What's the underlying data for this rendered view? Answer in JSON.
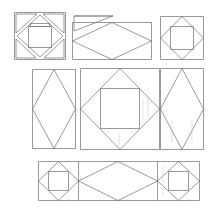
{
  "document": {
    "title": "Quilt Block Pattern Diagram",
    "kind": "patchwork-piecing-diagram",
    "canvas": {
      "width": 216,
      "height": 208,
      "background": "#ffffff"
    }
  },
  "style": {
    "line_color": "#6e6e6e",
    "line_color_dark": "#555555",
    "line_color_light": "#b9b9b9",
    "line_width": 0.7,
    "fill": "none"
  },
  "rows": [
    {
      "name": "top-row",
      "blocks": [
        {
          "id": "block-exploded-square-in-square",
          "name": "exploded-square-in-square-block",
          "label": "Square in a square, pieces separated",
          "x": 14,
          "y": 12,
          "w": 52,
          "h": 48
        },
        {
          "id": "block-wide-diamond-with-loose-triangle",
          "name": "wide-diamond-rectangle-block",
          "label": "Diamond in wide rectangle with loose triangle",
          "x": 72,
          "y": 15,
          "w": 80,
          "h": 45
        },
        {
          "id": "block-square-in-square-top-right",
          "name": "square-in-square-block",
          "label": "Square in a square",
          "x": 160,
          "y": 16,
          "w": 44,
          "h": 44
        }
      ]
    },
    {
      "name": "middle-row",
      "blocks": [
        {
          "id": "block-tall-diamond-left",
          "name": "tall-diamond-rectangle-block",
          "label": "Tall diamond in vertical rectangle",
          "x": 32,
          "y": 69,
          "w": 44,
          "h": 80
        },
        {
          "id": "block-big-square-in-square-center",
          "name": "large-square-in-square-block",
          "label": "Large square in a square",
          "x": 80,
          "y": 68,
          "w": 80,
          "h": 82
        },
        {
          "id": "block-tall-diamond-right",
          "name": "tall-diamond-rectangle-block",
          "label": "Tall diamond in vertical rectangle",
          "x": 160,
          "y": 68,
          "w": 44,
          "h": 82
        }
      ]
    },
    {
      "name": "bottom-row",
      "blocks": [
        {
          "id": "block-strip-square-left",
          "name": "square-in-square-block",
          "label": "Square in a square",
          "x": 38,
          "y": 161,
          "w": 40,
          "h": 40
        },
        {
          "id": "block-strip-diamond-center",
          "name": "wide-diamond-rectangle-block",
          "label": "Diamond in wide rectangle",
          "x": 78,
          "y": 161,
          "w": 78,
          "h": 40
        },
        {
          "id": "block-strip-square-right",
          "name": "square-in-square-block",
          "label": "Square in a square",
          "x": 156,
          "y": 161,
          "w": 44,
          "h": 40
        }
      ]
    }
  ]
}
